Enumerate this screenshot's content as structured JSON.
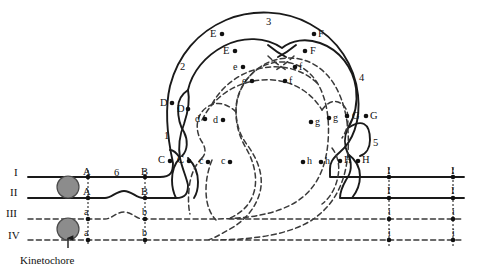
{
  "figure": {
    "type": "biology-diagram",
    "caption": "Kinetochore"
  },
  "strand_labels": {
    "roman": [
      {
        "id": "strand-I",
        "text": "I",
        "x": 14,
        "y": 167,
        "style": "solid"
      },
      {
        "id": "strand-II",
        "text": "II",
        "x": 10,
        "y": 187,
        "style": "solid"
      },
      {
        "id": "strand-III",
        "text": "III",
        "x": 6,
        "y": 208,
        "style": "dashed"
      },
      {
        "id": "strand-IV",
        "text": "IV",
        "x": 8,
        "y": 230,
        "style": "dashed"
      }
    ]
  },
  "region_numbers": [
    {
      "id": "region-1",
      "text": "1",
      "x": 164,
      "y": 131
    },
    {
      "id": "region-2",
      "text": "2",
      "x": 180,
      "y": 62
    },
    {
      "id": "region-3",
      "text": "3",
      "x": 266,
      "y": 17
    },
    {
      "id": "region-4",
      "text": "4",
      "x": 359,
      "y": 73
    },
    {
      "id": "region-5",
      "text": "5",
      "x": 373,
      "y": 138
    },
    {
      "id": "region-6",
      "text": "6",
      "x": 114,
      "y": 168
    }
  ],
  "marker_labels": [
    {
      "id": "label-A-1",
      "text": "A",
      "x": 83,
      "y": 167,
      "case": "upper"
    },
    {
      "id": "label-A-2",
      "text": "A",
      "x": 83,
      "y": 187,
      "case": "upper"
    },
    {
      "id": "label-a-1",
      "text": "a",
      "x": 84,
      "y": 207,
      "case": "lower"
    },
    {
      "id": "label-a-2",
      "text": "a",
      "x": 84,
      "y": 228,
      "case": "lower"
    },
    {
      "id": "label-B-1",
      "text": "B",
      "x": 141,
      "y": 167,
      "case": "upper"
    },
    {
      "id": "label-B-2",
      "text": "B",
      "x": 141,
      "y": 187,
      "case": "upper"
    },
    {
      "id": "label-b-1",
      "text": "b",
      "x": 142,
      "y": 207,
      "case": "lower"
    },
    {
      "id": "label-b-2",
      "text": "b",
      "x": 142,
      "y": 228,
      "case": "lower"
    },
    {
      "id": "label-C-1",
      "text": "C",
      "x": 158,
      "y": 155,
      "case": "upper"
    },
    {
      "id": "label-C-2",
      "text": "C",
      "x": 177,
      "y": 155,
      "case": "upper"
    },
    {
      "id": "label-c-1",
      "text": "c",
      "x": 199,
      "y": 156,
      "case": "lower"
    },
    {
      "id": "label-c-2",
      "text": "c",
      "x": 221,
      "y": 156,
      "case": "lower"
    },
    {
      "id": "label-D-1",
      "text": "D",
      "x": 160,
      "y": 98,
      "case": "upper"
    },
    {
      "id": "label-D-2",
      "text": "D",
      "x": 177,
      "y": 104,
      "case": "upper"
    },
    {
      "id": "label-d-1",
      "text": "d",
      "x": 195,
      "y": 114,
      "case": "lower"
    },
    {
      "id": "label-d-2",
      "text": "d",
      "x": 213,
      "y": 115,
      "case": "lower"
    },
    {
      "id": "label-E-1",
      "text": "E",
      "x": 210,
      "y": 29,
      "case": "upper"
    },
    {
      "id": "label-E-2",
      "text": "E",
      "x": 223,
      "y": 46,
      "case": "upper"
    },
    {
      "id": "label-e-1",
      "text": "e",
      "x": 233,
      "y": 62,
      "case": "lower"
    },
    {
      "id": "label-e-2",
      "text": "e",
      "x": 242,
      "y": 76,
      "case": "lower"
    },
    {
      "id": "label-F-1",
      "text": "F",
      "x": 318,
      "y": 29,
      "case": "upper"
    },
    {
      "id": "label-F-2",
      "text": "F",
      "x": 310,
      "y": 46,
      "case": "upper"
    },
    {
      "id": "label-f-1",
      "text": "f",
      "x": 299,
      "y": 62,
      "case": "lower"
    },
    {
      "id": "label-f-2",
      "text": "f",
      "x": 289,
      "y": 76,
      "case": "lower"
    },
    {
      "id": "label-G-1",
      "text": "G",
      "x": 352,
      "y": 111,
      "case": "upper"
    },
    {
      "id": "label-G-2",
      "text": "G",
      "x": 370,
      "y": 111,
      "case": "upper"
    },
    {
      "id": "label-g-1",
      "text": "g",
      "x": 315,
      "y": 117,
      "case": "lower"
    },
    {
      "id": "label-g-2",
      "text": "g",
      "x": 333,
      "y": 113,
      "case": "lower"
    },
    {
      "id": "label-H-1",
      "text": "H",
      "x": 344,
      "y": 155,
      "case": "upper"
    },
    {
      "id": "label-H-2",
      "text": "H",
      "x": 362,
      "y": 155,
      "case": "upper"
    },
    {
      "id": "label-h-1",
      "text": "h",
      "x": 307,
      "y": 156,
      "case": "lower"
    },
    {
      "id": "label-h-2",
      "text": "h",
      "x": 325,
      "y": 156,
      "case": "lower"
    },
    {
      "id": "label-I-1",
      "text": "I",
      "x": 387,
      "y": 166,
      "case": "upper"
    },
    {
      "id": "label-I-2",
      "text": "I",
      "x": 387,
      "y": 186,
      "case": "upper"
    },
    {
      "id": "label-i-1",
      "text": "i",
      "x": 388,
      "y": 207,
      "case": "lower"
    },
    {
      "id": "label-i-2",
      "text": "i",
      "x": 388,
      "y": 228,
      "case": "lower"
    },
    {
      "id": "label-I-3",
      "text": "I",
      "x": 451,
      "y": 166,
      "case": "upper"
    },
    {
      "id": "label-I-4",
      "text": "I",
      "x": 451,
      "y": 186,
      "case": "upper"
    },
    {
      "id": "label-i-3",
      "text": "i",
      "x": 452,
      "y": 207,
      "case": "lower"
    },
    {
      "id": "label-i-4",
      "text": "i",
      "x": 452,
      "y": 228,
      "case": "lower"
    }
  ],
  "colors": {
    "line": "#1a1a1a",
    "dashed_line": "#3a3a3a",
    "kinetochore_fill": "#8c8c8c",
    "kinetochore_stroke": "#4a4a4a",
    "text": "#111111",
    "background": "#ffffff"
  },
  "kinetochores": [
    {
      "id": "kinetochore-upper",
      "cx": 68,
      "cy": 177,
      "r": 11
    },
    {
      "id": "kinetochore-lower",
      "cx": 68,
      "cy": 219,
      "r": 11
    }
  ],
  "caption_label": {
    "text": "Kinetochore",
    "x": 20,
    "y": 255
  }
}
